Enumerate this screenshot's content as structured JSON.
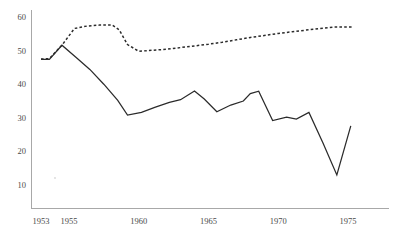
{
  "chart_data": {
    "type": "line",
    "title": "",
    "subtitle": "",
    "xlabel": "",
    "ylabel": "",
    "xlim": [
      1953,
      1976
    ],
    "ylim": [
      4,
      62
    ],
    "grid": false,
    "legend": "none",
    "x_ticks": [
      "1953",
      "1955",
      "1960",
      "1965",
      "1970",
      "1975"
    ],
    "x_tick_values": [
      1953,
      1955,
      1960,
      1965,
      1970,
      1975
    ],
    "y_ticks": [
      "10",
      "20",
      "30",
      "40",
      "50",
      "60"
    ],
    "y_tick_values": [
      10,
      20,
      30,
      40,
      50,
      60
    ],
    "series": [
      {
        "name": "dashed-series",
        "style": "dashed",
        "color": "#2b2b2b",
        "x": [
          1953,
          1953.6,
          1954.5,
          1955.4,
          1956.3,
          1957.2,
          1958.1,
          1958.6,
          1959.2,
          1960.0,
          1961.0,
          1962.0,
          1963.0,
          1964.0,
          1965.0,
          1966.0,
          1967.0,
          1968.0,
          1969.0,
          1970.0,
          1971.0,
          1972.0,
          1973.0,
          1974.0,
          1975.3
        ],
        "values": [
          47.5,
          47.6,
          51.6,
          56.6,
          57.3,
          57.6,
          57.6,
          56.2,
          51.8,
          49.8,
          50.1,
          50.4,
          50.9,
          51.4,
          51.9,
          52.5,
          53.2,
          53.9,
          54.5,
          55.1,
          55.6,
          56.1,
          56.6,
          57.0,
          57.0
        ]
      },
      {
        "name": "solid-series",
        "style": "solid",
        "color": "#2b2b2b",
        "x": [
          1953,
          1953.6,
          1954.5,
          1955.5,
          1956.5,
          1957.5,
          1958.5,
          1959.2,
          1960.2,
          1961.2,
          1962.2,
          1963.0,
          1964.0,
          1964.7,
          1965.6,
          1966.6,
          1967.5,
          1968.0,
          1968.6,
          1969.6,
          1970.6,
          1971.3,
          1972.2,
          1973.2,
          1974.2,
          1975.2
        ],
        "values": [
          47.4,
          47.4,
          51.6,
          48.0,
          44.4,
          40.0,
          35.2,
          30.8,
          31.6,
          33.2,
          34.6,
          35.4,
          38.0,
          35.6,
          31.8,
          33.8,
          35.0,
          37.2,
          37.9,
          29.2,
          30.2,
          29.6,
          31.6,
          22.6,
          13.0,
          27.6
        ]
      }
    ]
  }
}
